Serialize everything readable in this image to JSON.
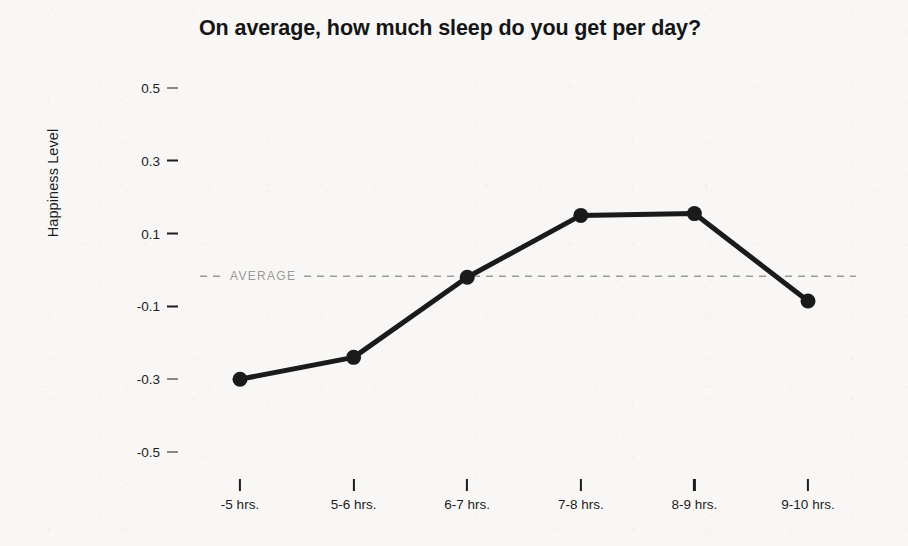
{
  "chart_data": {
    "type": "line",
    "title": "On average, how much sleep do you get per day?",
    "xlabel": "",
    "ylabel": "Happiness Level",
    "categories": [
      "-5 hrs.",
      "5-6 hrs.",
      "6-7 hrs.",
      "7-8 hrs.",
      "8-9 hrs.",
      "9-10 hrs."
    ],
    "values": [
      -0.3,
      -0.24,
      -0.02,
      0.15,
      0.155,
      -0.085
    ],
    "series": [
      {
        "name": "Happiness Level",
        "values": [
          -0.3,
          -0.24,
          -0.02,
          0.15,
          0.155,
          -0.085
        ]
      }
    ],
    "ylim": [
      -0.58,
      0.6
    ],
    "yticks": [
      0.5,
      0.3,
      0.1,
      -0.1,
      -0.3,
      -0.5
    ],
    "ytick_labels": [
      "0.5",
      "0.3",
      "0.1",
      "-0.1",
      "-0.3",
      "-0.5"
    ],
    "grid": false,
    "legend": null,
    "annotations": [
      {
        "name": "average-reference-line",
        "label": "AVERAGE",
        "value": -0.017,
        "style": "dashed",
        "color": "#9a9a98",
        "orientation": "horizontal"
      }
    ],
    "line_color": "#1a1a1a",
    "marker_color": "#1a1a1a",
    "marker": "circle",
    "background_color": "#f8f7f5"
  },
  "axis": {
    "y_title": "Happiness Level"
  }
}
